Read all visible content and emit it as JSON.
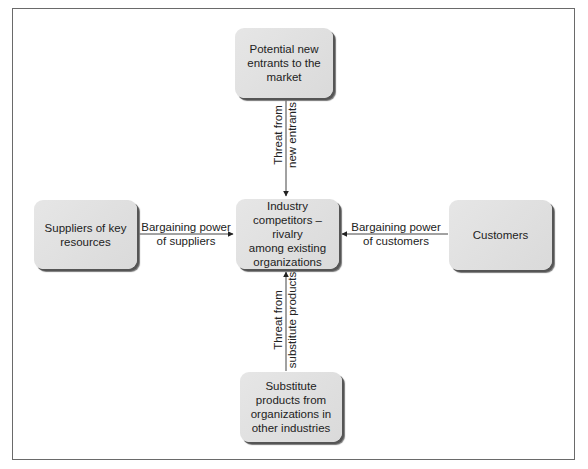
{
  "diagram": {
    "nodes": {
      "top": {
        "label": "Potential new\nentrants to the\nmarket"
      },
      "center": {
        "label": "Industry\ncompetitors – rivalry\namong existing\norganizations"
      },
      "left": {
        "label": "Suppliers of key\nresources"
      },
      "right": {
        "label": "Customers"
      },
      "bottom": {
        "label": "Substitute\nproducts from\norganizations in\nother industries"
      }
    },
    "edges": {
      "top_to_center": {
        "label": "Threat from\nnew entrants"
      },
      "left_to_center": {
        "label": "Bargaining power\nof suppliers"
      },
      "right_to_center": {
        "label": "Bargaining power\nof customers"
      },
      "bottom_to_center": {
        "label": "Threat from\nsubstitute products"
      }
    },
    "colors": {
      "box_fill": "#e0e0e0",
      "box_shadow": "#555555",
      "line": "#444444",
      "frame": "#6a6a6a"
    }
  }
}
